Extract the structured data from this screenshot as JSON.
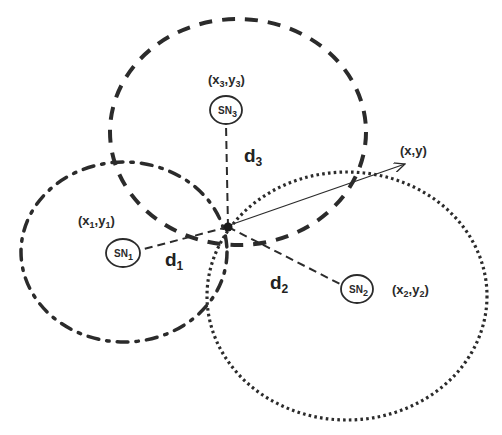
{
  "diagram": {
    "type": "trilateration",
    "colors": {
      "stroke": "#2b2b2b",
      "background": "#ffffff"
    },
    "target": {
      "label": "(x,y)",
      "position": [
        228,
        227
      ]
    },
    "sensor_nodes": [
      {
        "id": "SN1",
        "label_main": "SN",
        "label_sub": "1",
        "coord_label": {
          "x": "x",
          "x_sub": "1",
          "y": "y",
          "y_sub": "1"
        },
        "distance_label": {
          "main": "d",
          "sub": "1"
        },
        "range_circle_style": "dash-dot"
      },
      {
        "id": "SN2",
        "label_main": "SN",
        "label_sub": "2",
        "coord_label": {
          "x": "x",
          "x_sub": "2",
          "y": "y",
          "y_sub": "2"
        },
        "distance_label": {
          "main": "d",
          "sub": "2"
        },
        "range_circle_style": "dotted"
      },
      {
        "id": "SN3",
        "label_main": "SN",
        "label_sub": "3",
        "coord_label": {
          "x": "x",
          "x_sub": "3",
          "y": "y",
          "y_sub": "3"
        },
        "distance_label": {
          "main": "d",
          "sub": "3"
        },
        "range_circle_style": "dashed"
      }
    ],
    "punct": {
      "open": "(",
      "comma": ",",
      "close": ")"
    }
  }
}
